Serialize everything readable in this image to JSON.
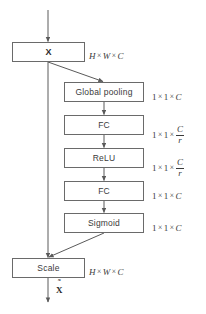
{
  "diagram": {
    "style": {
      "line_color": "#6a6a6a",
      "text_color": "#3a3a3a",
      "background": "#ffffff"
    },
    "input": {
      "label": "X",
      "dim": {
        "a": "H",
        "b": "W",
        "c": "C",
        "sep": "×"
      }
    },
    "branch_nodes": [
      {
        "label": "Global pooling",
        "dim_prefix_1": "1",
        "dim_prefix_2": "1",
        "dim_tail": "C",
        "dim_is_fraction": false
      },
      {
        "label": "FC",
        "dim_prefix_1": "1",
        "dim_prefix_2": "1",
        "dim_tail": "C",
        "dim_denom": "r",
        "dim_is_fraction": true
      },
      {
        "label": "ReLU",
        "dim_prefix_1": "1",
        "dim_prefix_2": "1",
        "dim_tail": "C",
        "dim_denom": "r",
        "dim_is_fraction": true
      },
      {
        "label": "FC",
        "dim_prefix_1": "1",
        "dim_prefix_2": "1",
        "dim_tail": "C",
        "dim_is_fraction": false
      },
      {
        "label": "Sigmoid",
        "dim_prefix_1": "1",
        "dim_prefix_2": "1",
        "dim_tail": "C",
        "dim_is_fraction": false
      }
    ],
    "merge": {
      "label": "Scale",
      "dim": {
        "a": "H",
        "b": "W",
        "c": "C",
        "sep": "×"
      }
    },
    "output": {
      "tilde": "˜",
      "label": "X"
    }
  }
}
